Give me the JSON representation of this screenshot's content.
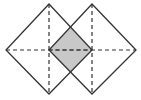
{
  "diagram": {
    "colors": {
      "stroke": "#333333",
      "shade": "#c8c8c8",
      "background": "#ffffff"
    },
    "squares": [
      {
        "name": "left-square",
        "points": [
          [
            49,
            4
          ],
          [
            92,
            50
          ],
          [
            49,
            94
          ],
          [
            6,
            50
          ]
        ],
        "diagonals": [
          [
            [
              49,
              4
            ],
            [
              49,
              94
            ]
          ],
          [
            [
              6,
              50
            ],
            [
              92,
              50
            ]
          ]
        ]
      },
      {
        "name": "right-square",
        "points": [
          [
            92,
            4
          ],
          [
            136,
            50
          ],
          [
            92,
            94
          ],
          [
            49,
            50
          ]
        ],
        "diagonals": [
          [
            [
              92,
              4
            ],
            [
              92,
              94
            ]
          ],
          [
            [
              49,
              50
            ],
            [
              136,
              50
            ]
          ]
        ]
      }
    ],
    "overlap": {
      "points": [
        [
          70.5,
          28
        ],
        [
          92,
          50
        ],
        [
          70.5,
          72
        ],
        [
          49,
          50
        ]
      ]
    }
  }
}
